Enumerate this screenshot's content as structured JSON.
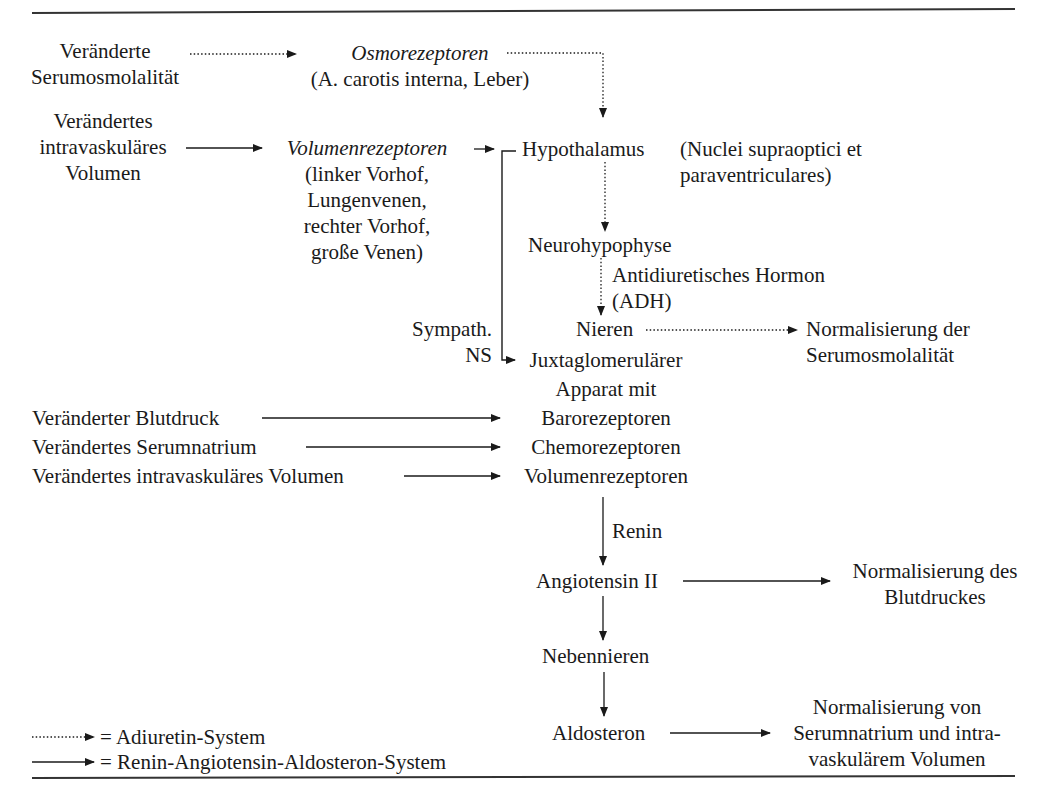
{
  "diagram": {
    "colors": {
      "ink": "#1a1a1a",
      "background": "#ffffff",
      "rule": "#333333"
    },
    "nodes": {
      "input_serumosmolality": [
        "Veränderte",
        "Serumosmolalität"
      ],
      "osmoreceptors": {
        "title": "Osmorezeptoren",
        "detail": "(A. carotis interna, Leber)"
      },
      "input_volume_top": [
        "Verändertes",
        "intravaskuläres",
        "Volumen"
      ],
      "volume_receptors_top": {
        "title": "Volumenrezeptoren",
        "detail": [
          "(linker Vorhof,",
          "Lungenvenen,",
          "rechter Vorhof,",
          "große Venen)"
        ]
      },
      "hypothalamus": {
        "title": "Hypothalamus",
        "detail": [
          "(Nuclei supraoptici et",
          "paraventriculares)"
        ]
      },
      "neurohypophysis": "Neurohypophyse",
      "adh_label": [
        "Antidiuretisches Hormon",
        "(ADH)"
      ],
      "kidneys": "Nieren",
      "norm_serumosmolality": [
        "Normalisierung der",
        "Serumosmolalität"
      ],
      "sympathetic_label": [
        "Sympath.",
        "NS"
      ],
      "juxtaglomerular": [
        "Juxtaglomerulärer",
        "Apparat mit",
        "Barorezeptoren",
        "Chemorezeptoren",
        "Volumenrezeptoren"
      ],
      "input_bloodpressure": "Veränderter Blutdruck",
      "input_serumsodium": "Verändertes Serumnatrium",
      "input_volume_bottom": "Verändertes intravaskuläres Volumen",
      "renin_label": "Renin",
      "angiotensin": "Angiotensin II",
      "norm_bloodpressure": [
        "Normalisierung des",
        "Blutdruckes"
      ],
      "adrenals": "Nebennieren",
      "aldosterone": "Aldosteron",
      "norm_sodium_volume": [
        "Normalisierung von",
        "Serumnatrium und intra-",
        "vaskulärem Volumen"
      ]
    },
    "legend": [
      {
        "style": "dotted",
        "label": "= Adiuretin-System"
      },
      {
        "style": "solid",
        "label": "= Renin-Angiotensin-Aldosteron-System"
      }
    ]
  }
}
